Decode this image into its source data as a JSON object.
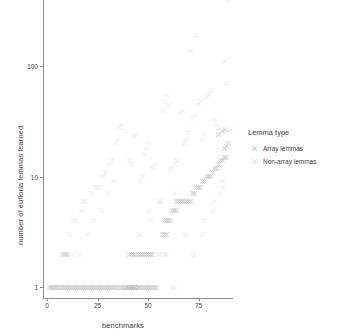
{
  "chart_data": {
    "type": "scatter",
    "title": "",
    "xlabel": "benchmarks",
    "ylabel": "number of eufloria lemmas learned",
    "xlim": [
      -2,
      92
    ],
    "ylim": [
      0.8,
      400
    ],
    "yscale": "log",
    "xticks": [
      0,
      25,
      50,
      75
    ],
    "yticks": [
      1,
      10,
      100
    ],
    "grid": false,
    "legend": {
      "title": "Lemma type",
      "position": "right",
      "entries": [
        {
          "name": "Array lemmas",
          "marker": "x",
          "color": "#b9b9b9"
        },
        {
          "name": "Non-array lemmas",
          "marker": "x",
          "color": "#dcdcdc"
        }
      ]
    },
    "series": [
      {
        "name": "Array lemmas",
        "marker": "x",
        "color": "#b9b9b9",
        "points": [
          [
            1,
            1
          ],
          [
            2,
            1
          ],
          [
            3,
            1
          ],
          [
            4,
            1
          ],
          [
            5,
            1
          ],
          [
            6,
            1
          ],
          [
            7,
            1
          ],
          [
            8,
            1
          ],
          [
            9,
            1
          ],
          [
            10,
            1
          ],
          [
            11,
            1
          ],
          [
            12,
            1
          ],
          [
            13,
            1
          ],
          [
            14,
            1
          ],
          [
            15,
            1
          ],
          [
            16,
            1
          ],
          [
            17,
            1
          ],
          [
            18,
            1
          ],
          [
            19,
            1
          ],
          [
            20,
            1
          ],
          [
            21,
            1
          ],
          [
            22,
            1
          ],
          [
            23,
            1
          ],
          [
            24,
            1
          ],
          [
            25,
            1
          ],
          [
            26,
            1
          ],
          [
            27,
            1
          ],
          [
            28,
            1
          ],
          [
            29,
            1
          ],
          [
            30,
            1
          ],
          [
            31,
            1
          ],
          [
            32,
            1
          ],
          [
            33,
            1
          ],
          [
            34,
            1
          ],
          [
            35,
            1
          ],
          [
            36,
            1
          ],
          [
            37,
            1
          ],
          [
            38,
            1
          ],
          [
            39,
            1
          ],
          [
            40,
            1
          ],
          [
            41,
            1
          ],
          [
            42,
            1
          ],
          [
            43,
            1
          ],
          [
            44,
            1
          ],
          [
            45,
            1
          ],
          [
            46,
            1
          ],
          [
            47,
            1
          ],
          [
            48,
            1
          ],
          [
            49,
            1
          ],
          [
            50,
            1
          ],
          [
            51,
            1
          ],
          [
            52,
            1
          ],
          [
            53,
            1
          ],
          [
            54,
            1
          ],
          [
            40,
            1
          ],
          [
            41,
            1
          ],
          [
            42,
            1
          ],
          [
            43,
            1
          ],
          [
            44,
            1
          ],
          [
            45,
            1
          ],
          [
            41,
            2
          ],
          [
            42,
            2
          ],
          [
            43,
            2
          ],
          [
            44,
            2
          ],
          [
            45,
            2
          ],
          [
            46,
            2
          ],
          [
            47,
            2
          ],
          [
            48,
            2
          ],
          [
            49,
            2
          ],
          [
            50,
            2
          ],
          [
            51,
            2
          ],
          [
            52,
            2
          ],
          [
            57,
            3
          ],
          [
            58,
            3
          ],
          [
            59,
            3
          ],
          [
            58,
            4
          ],
          [
            59,
            4
          ],
          [
            60,
            4
          ],
          [
            61,
            4
          ],
          [
            62,
            5
          ],
          [
            63,
            5
          ],
          [
            64,
            5
          ],
          [
            64,
            6
          ],
          [
            65,
            6
          ],
          [
            66,
            6
          ],
          [
            67,
            6
          ],
          [
            68,
            6
          ],
          [
            69,
            6
          ],
          [
            70,
            6
          ],
          [
            71,
            6
          ],
          [
            72,
            7
          ],
          [
            73,
            7
          ],
          [
            74,
            8
          ],
          [
            75,
            8
          ],
          [
            76,
            8
          ],
          [
            77,
            9
          ],
          [
            78,
            9
          ],
          [
            79,
            10
          ],
          [
            80,
            10
          ],
          [
            81,
            10
          ],
          [
            82,
            11
          ],
          [
            83,
            12
          ],
          [
            84,
            12
          ],
          [
            85,
            13
          ],
          [
            86,
            14
          ],
          [
            87,
            14
          ],
          [
            88,
            15
          ],
          [
            89,
            15
          ],
          [
            88,
            18
          ],
          [
            89,
            19
          ],
          [
            90,
            20
          ],
          [
            85,
            24
          ],
          [
            87,
            26
          ],
          [
            88,
            27
          ],
          [
            4,
            1
          ],
          [
            8,
            2
          ],
          [
            9,
            2
          ],
          [
            10,
            2
          ]
        ]
      },
      {
        "name": "Non-array lemmas",
        "marker": "x",
        "color": "#e0e0e0",
        "points": [
          [
            4,
            1
          ],
          [
            7,
            2
          ],
          [
            8,
            2
          ],
          [
            9,
            2
          ],
          [
            11,
            3
          ],
          [
            13,
            4
          ],
          [
            14,
            4
          ],
          [
            17,
            5
          ],
          [
            18,
            6
          ],
          [
            19,
            6
          ],
          [
            22,
            7
          ],
          [
            24,
            8
          ],
          [
            25,
            8
          ],
          [
            26,
            8
          ],
          [
            28,
            10
          ],
          [
            29,
            11
          ],
          [
            31,
            13
          ],
          [
            32,
            14
          ],
          [
            34,
            20
          ],
          [
            35,
            22
          ],
          [
            36,
            28
          ],
          [
            37,
            30
          ],
          [
            39,
            26
          ],
          [
            41,
            14
          ],
          [
            42,
            13
          ],
          [
            43,
            23
          ],
          [
            44,
            24
          ],
          [
            46,
            9
          ],
          [
            47,
            10
          ],
          [
            48,
            16
          ],
          [
            49,
            18
          ],
          [
            50,
            20
          ],
          [
            52,
            12
          ],
          [
            53,
            13
          ],
          [
            55,
            6
          ],
          [
            56,
            6
          ],
          [
            57,
            40
          ],
          [
            58,
            48
          ],
          [
            59,
            55
          ],
          [
            60,
            44
          ],
          [
            61,
            12
          ],
          [
            63,
            13
          ],
          [
            64,
            14
          ],
          [
            66,
            38
          ],
          [
            67,
            40
          ],
          [
            68,
            20
          ],
          [
            69,
            22
          ],
          [
            70,
            25
          ],
          [
            71,
            140
          ],
          [
            72,
            34
          ],
          [
            73,
            36
          ],
          [
            74,
            190
          ],
          [
            75,
            45
          ],
          [
            76,
            48
          ],
          [
            77,
            22
          ],
          [
            78,
            24
          ],
          [
            79,
            52
          ],
          [
            80,
            56
          ],
          [
            81,
            60
          ],
          [
            83,
            33
          ],
          [
            84,
            30
          ],
          [
            85,
            28
          ],
          [
            86,
            12
          ],
          [
            87,
            9
          ],
          [
            88,
            110
          ],
          [
            90,
            26
          ],
          [
            91,
            27
          ],
          [
            63,
            7
          ],
          [
            64,
            6
          ],
          [
            50,
            5
          ],
          [
            51,
            4
          ],
          [
            45,
            3
          ],
          [
            46,
            3
          ],
          [
            33,
            9
          ],
          [
            30,
            7
          ],
          [
            27,
            5
          ],
          [
            23,
            4
          ],
          [
            20,
            3
          ],
          [
            16,
            2
          ],
          [
            12,
            2
          ],
          [
            6,
            1
          ],
          [
            58,
            2
          ],
          [
            59,
            2
          ],
          [
            72,
            2
          ],
          [
            73,
            2
          ],
          [
            68,
            3
          ],
          [
            69,
            3
          ],
          [
            77,
            3
          ],
          [
            78,
            4
          ],
          [
            82,
            5
          ],
          [
            83,
            6
          ],
          [
            86,
            7
          ],
          [
            87,
            8
          ],
          [
            89,
            70
          ],
          [
            90,
            400
          ],
          [
            55,
            2
          ],
          [
            56,
            2
          ],
          [
            35,
            1
          ],
          [
            36,
            1
          ],
          [
            62,
            1
          ],
          [
            63,
            1
          ]
        ]
      }
    ]
  }
}
